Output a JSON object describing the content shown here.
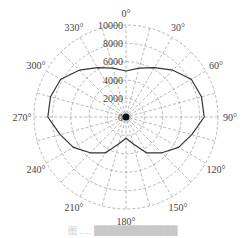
{
  "chart_data": {
    "type": "polar-line",
    "title": "",
    "angle_unit": "degrees",
    "angle_direction": "clockwise",
    "zero_location": "top",
    "angle_ticks": [
      "0°",
      "30°",
      "60°",
      "90°",
      "120°",
      "150°",
      "180°",
      "210°",
      "240°",
      "270°",
      "300°",
      "330°"
    ],
    "radial_ticks": [
      "0",
      "2000",
      "4000",
      "6000",
      "8000",
      "10000"
    ],
    "rlim": [
      0,
      10000
    ],
    "grid": true,
    "grid_style": "dashed",
    "radial_grid_step_deg": 15,
    "series": [
      {
        "name": "pattern",
        "theta": [
          0,
          15,
          30,
          45,
          60,
          75,
          90,
          105,
          120,
          135,
          150,
          165,
          180,
          195,
          210,
          225,
          240,
          255,
          270,
          285,
          300,
          315,
          330,
          345
        ],
        "r": [
          5000,
          5500,
          6200,
          7200,
          8200,
          8500,
          8500,
          7400,
          6600,
          5500,
          4500,
          3000,
          2300,
          3000,
          4500,
          5500,
          6600,
          7400,
          8500,
          8500,
          8200,
          7200,
          6200,
          5500
        ]
      }
    ]
  },
  "caption": "图 ‥‥ ████████████"
}
